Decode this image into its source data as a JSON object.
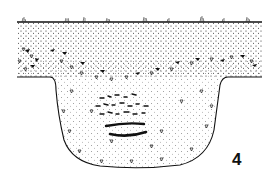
{
  "figure": {
    "label": "4",
    "colors": {
      "ink": "#111111",
      "background": "#ffffff"
    },
    "layers": [
      {
        "name": "topsoil",
        "pattern": "fine dots"
      },
      {
        "name": "stone layer",
        "pattern": "triangles and filled stones"
      },
      {
        "name": "pit fill",
        "pattern": "fine dots with open triangles"
      },
      {
        "name": "charcoal lens",
        "pattern": "black dashes"
      }
    ]
  }
}
